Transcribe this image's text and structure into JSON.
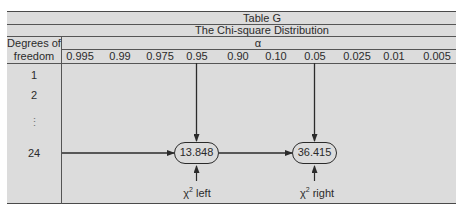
{
  "table": {
    "title": "Table G",
    "subtitle": "The Chi-square Distribution",
    "alpha_label": "α",
    "row_header_line1": "Degrees of",
    "row_header_line2": "freedom",
    "columns": [
      "0.995",
      "0.99",
      "0.975",
      "0.95",
      "0.90",
      "0.10",
      "0.05",
      "0.025",
      "0.01",
      "0.005"
    ],
    "rows": [
      "1",
      "2",
      "⋮",
      "24"
    ],
    "highlight": {
      "df": "24",
      "left_alpha": "0.95",
      "right_alpha": "0.05",
      "left_value": "13.848",
      "right_value": "36.415",
      "left_label_symbol": "χ",
      "left_label_exp": "2",
      "left_label_text": " left",
      "right_label_symbol": "χ",
      "right_label_exp": "2",
      "right_label_text": " right"
    }
  },
  "colors": {
    "background": "#dcdcdc",
    "lines": "#4a4a4a",
    "text": "#2b2b2b"
  }
}
